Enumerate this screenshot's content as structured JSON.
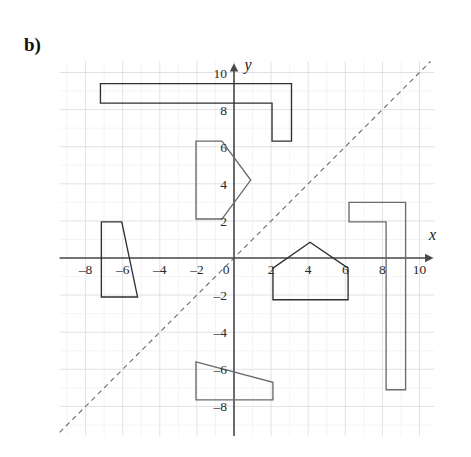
{
  "figure": {
    "part_label": "b)",
    "background_color": "#ffffff"
  },
  "axes": {
    "x_axis_name": "x",
    "y_axis_name": "y",
    "origin_label": "0",
    "x_ticks": [
      {
        "value": -8,
        "label": "–8"
      },
      {
        "value": -6,
        "label": "–6"
      },
      {
        "value": -4,
        "label": "–4"
      },
      {
        "value": -2,
        "label": "–2"
      },
      {
        "value": 2,
        "label": "2"
      },
      {
        "value": 4,
        "label": "4"
      },
      {
        "value": 6,
        "label": "6"
      },
      {
        "value": 8,
        "label": "8"
      },
      {
        "value": 10,
        "label": "10"
      }
    ],
    "y_ticks": [
      {
        "value": 10,
        "label": "10"
      },
      {
        "value": 8,
        "label": "8"
      },
      {
        "value": 6,
        "label": "6"
      },
      {
        "value": 4,
        "label": "4"
      },
      {
        "value": 2,
        "label": "2"
      },
      {
        "value": -2,
        "label": "–2"
      },
      {
        "value": -4,
        "label": "–4"
      },
      {
        "value": -6,
        "label": "–6"
      },
      {
        "value": -8,
        "label": "–8"
      }
    ],
    "axis_color": "#4a4a4a",
    "grid_color": "#dcdce4",
    "grid_minor_color": "#ececf2",
    "x_range": [
      -9.4,
      10.8
    ],
    "y_range": [
      -9.6,
      10.6
    ],
    "grid_step": 1
  },
  "chart_data": {
    "type": "scatter",
    "title": "b)",
    "xlabel": "x",
    "ylabel": "y",
    "xlim": [
      -9.4,
      10.8
    ],
    "ylim": [
      -9.6,
      10.6
    ],
    "grid": true,
    "legend": "none",
    "mirror_line": {
      "name": "line-of-reflection",
      "equation": "y = x",
      "style": "dashed",
      "color": "#6b6b6b",
      "x_start": -9.4,
      "y_start": -9.4,
      "x_end": 10.6,
      "y_end": 10.6
    },
    "shapes": [
      {
        "name": "top-L-shape",
        "stroke": "#2f2f2f",
        "fill": "none",
        "points": [
          [
            -7.2,
            9.4
          ],
          [
            3.1,
            9.4
          ],
          [
            3.1,
            6.3
          ],
          [
            2.05,
            6.3
          ],
          [
            2.05,
            8.35
          ],
          [
            -7.2,
            8.35
          ]
        ]
      },
      {
        "name": "arrow-pentagon-upper",
        "stroke": "#6a6a6a",
        "fill": "none",
        "points": [
          [
            -2.05,
            6.3
          ],
          [
            -0.65,
            6.3
          ],
          [
            0.9,
            4.2
          ],
          [
            -0.65,
            2.1
          ],
          [
            -2.05,
            2.1
          ]
        ]
      },
      {
        "name": "left-trapezoid",
        "stroke": "#2f2f2f",
        "fill": "none",
        "points": [
          [
            -7.15,
            1.95
          ],
          [
            -6.05,
            1.95
          ],
          [
            -5.2,
            -2.1
          ],
          [
            -7.15,
            -2.1
          ]
        ]
      },
      {
        "name": "right-L-shape",
        "stroke": "#6a6a6a",
        "fill": "none",
        "points": [
          [
            6.2,
            3.0
          ],
          [
            9.25,
            3.0
          ],
          [
            9.25,
            -7.1
          ],
          [
            8.2,
            -7.1
          ],
          [
            8.2,
            1.95
          ],
          [
            6.2,
            1.95
          ]
        ]
      },
      {
        "name": "house-pentagon",
        "stroke": "#2f2f2f",
        "fill": "none",
        "points": [
          [
            4.1,
            0.85
          ],
          [
            6.15,
            -0.55
          ],
          [
            6.15,
            -2.25
          ],
          [
            2.1,
            -2.25
          ],
          [
            2.1,
            -0.55
          ]
        ]
      },
      {
        "name": "bottom-trapezoid",
        "stroke": "#6a6a6a",
        "fill": "none",
        "points": [
          [
            -2.05,
            -5.6
          ],
          [
            2.1,
            -6.7
          ],
          [
            2.1,
            -7.65
          ],
          [
            -2.05,
            -7.65
          ]
        ]
      }
    ]
  }
}
